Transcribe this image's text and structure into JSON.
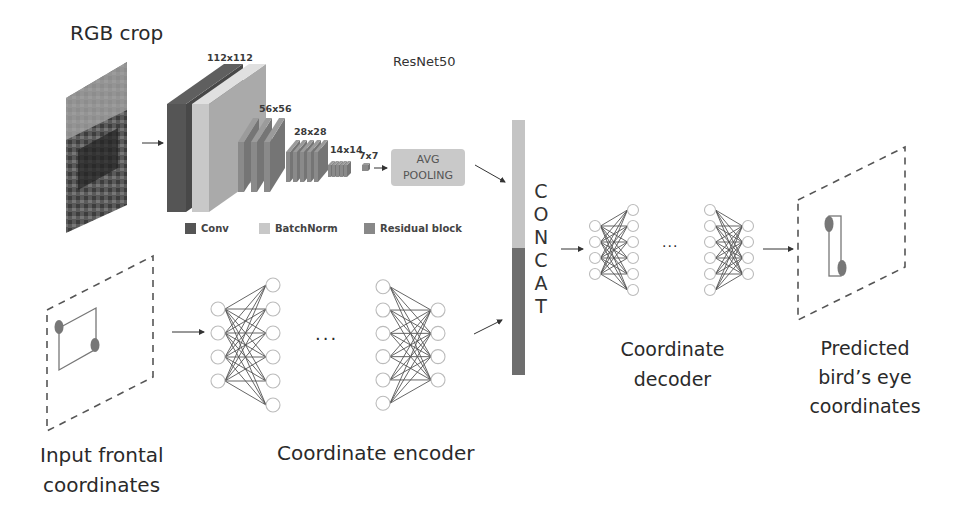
{
  "labels": {
    "rgb_crop": "RGB crop",
    "resnet": "ResNet50",
    "avg_pooling_line1": "AVG",
    "avg_pooling_line2": "POOLING",
    "concat_letters": [
      "C",
      "O",
      "N",
      "C",
      "A",
      "T"
    ],
    "input_line1": "Input frontal",
    "input_line2": "coordinates",
    "encoder": "Coordinate encoder",
    "decoder_line1": "Coordinate",
    "decoder_line2": "decoder",
    "predicted_line1": "Predicted",
    "predicted_line2": "bird’s eye",
    "predicted_line3": "coordinates",
    "ellipsis": "···"
  },
  "resolutions": [
    "112x112",
    "56x56",
    "28x28",
    "14x14",
    "7x7"
  ],
  "legend": [
    {
      "label": "Conv",
      "color": "#555555"
    },
    {
      "label": "BatchNorm",
      "color": "#c8c8c8"
    },
    {
      "label": "Residual block",
      "color": "#888888"
    }
  ],
  "colors": {
    "conv": "#555555",
    "batchnorm": "#c8c8c8",
    "residual": "#8a8a8a",
    "concat_top": "#c4c4c4",
    "concat_bottom": "#6e6e6e"
  },
  "encoder_networks": [
    {
      "left_nodes": 4,
      "right_nodes": 6
    },
    {
      "left_nodes": 6,
      "right_nodes": 4
    }
  ],
  "decoder_networks": [
    {
      "left_nodes": 4,
      "right_nodes": 6
    },
    {
      "left_nodes": 6,
      "right_nodes": 4
    }
  ]
}
